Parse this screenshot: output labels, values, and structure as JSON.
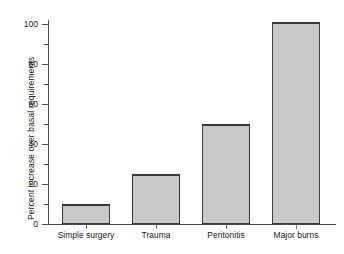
{
  "chart_data": {
    "type": "bar",
    "title": "",
    "xlabel": "",
    "ylabel": "Percent increase over basal requirements",
    "categories": [
      "Simple surgery",
      "Trauma",
      "Peritonitis",
      "Major burns"
    ],
    "values": [
      10,
      25,
      50,
      101
    ],
    "ylim": [
      0,
      105
    ],
    "y_ticks_major": [
      0,
      20,
      40,
      60,
      80,
      100
    ],
    "y_ticks_minor": [
      10,
      30,
      50,
      70,
      90
    ],
    "y_tick_labels": [
      "0",
      "20",
      "40",
      "60",
      "80",
      "100"
    ],
    "grid": false,
    "legend": false,
    "bar_color": "#c9c9c9",
    "bar_edge_color": "#3a3a3a",
    "axis_color": "#4a4a4a",
    "background": "#ffffff"
  },
  "axis": {
    "y_title": "Percent increase over basal requirements",
    "tick_labels": {
      "t0": "0",
      "t20": "20",
      "t40": "40",
      "t60": "60",
      "t80": "80",
      "t100": "100"
    }
  },
  "bars": [
    {
      "label": "Simple surgery",
      "value": 10
    },
    {
      "label": "Trauma",
      "value": 25
    },
    {
      "label": "Peritonitis",
      "value": 50
    },
    {
      "label": "Major burns",
      "value": 101
    }
  ]
}
